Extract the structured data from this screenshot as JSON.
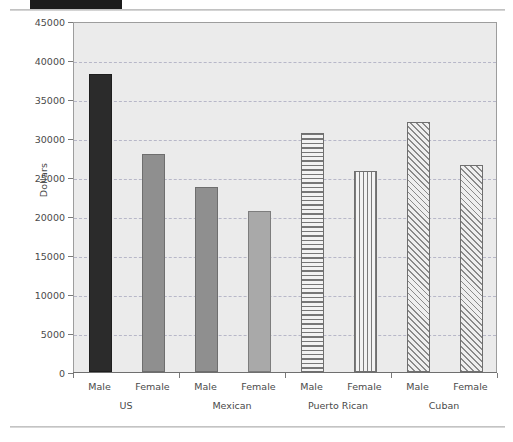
{
  "page": {
    "redaction_label": "",
    "figure_caption": ""
  },
  "chart_data": {
    "type": "bar",
    "title": "",
    "xlabel": "",
    "ylabel": "Dollars",
    "ylim": [
      0,
      45000
    ],
    "ytick_values": [
      0,
      5000,
      10000,
      15000,
      20000,
      25000,
      30000,
      35000,
      40000,
      45000
    ],
    "ytick_labels": [
      "0",
      "5000",
      "10000",
      "15000",
      "20000",
      "25000",
      "30000",
      "35000",
      "40000",
      "45000"
    ],
    "grid": true,
    "legend": null,
    "groups": [
      "US",
      "Mexican",
      "Puerto Rican",
      "Cuban"
    ],
    "categories": [
      "Male",
      "Female",
      "Male",
      "Female",
      "Male",
      "Female",
      "Male",
      "Female"
    ],
    "values": [
      38200,
      27900,
      23700,
      20700,
      30700,
      25800,
      32000,
      26600
    ],
    "bars": [
      {
        "group": "US",
        "sex": "Male",
        "value": 38200,
        "fill": "solid-dark"
      },
      {
        "group": "US",
        "sex": "Female",
        "value": 27900,
        "fill": "solid-mid"
      },
      {
        "group": "Mexican",
        "sex": "Male",
        "value": 23700,
        "fill": "solid-mid"
      },
      {
        "group": "Mexican",
        "sex": "Female",
        "value": 20700,
        "fill": "solid-light"
      },
      {
        "group": "Puerto Rican",
        "sex": "Male",
        "value": 30700,
        "fill": "hatch-horiz"
      },
      {
        "group": "Puerto Rican",
        "sex": "Female",
        "value": 25800,
        "fill": "hatch-vert"
      },
      {
        "group": "Cuban",
        "sex": "Male",
        "value": 32000,
        "fill": "hatch-diag"
      },
      {
        "group": "Cuban",
        "sex": "Female",
        "value": 26600,
        "fill": "hatch-diag"
      }
    ],
    "colors": {
      "plot_background": "#ebebeb",
      "gridline": "#b7b7c8",
      "axis": "#6f6f6f",
      "text": "#4a4a4a",
      "bar_dark": "#2b2b2b",
      "bar_mid": "#8f8f8f",
      "bar_light": "#a9a9a9"
    }
  }
}
